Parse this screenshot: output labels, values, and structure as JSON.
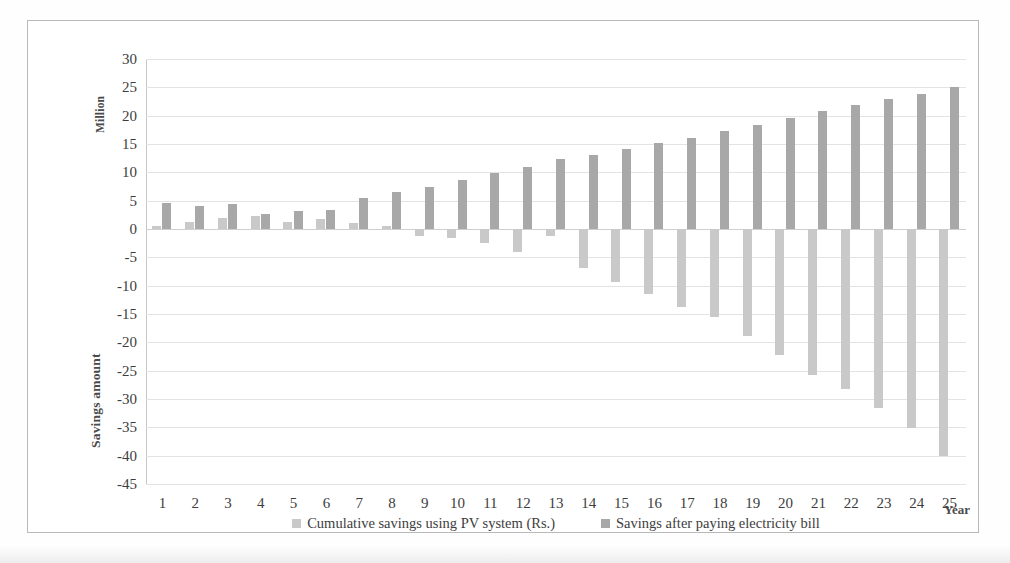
{
  "chart_data": {
    "type": "bar",
    "title": "",
    "xlabel": "Year",
    "ylabel": "Savings amount",
    "y_secondary_label": "Million",
    "grid": true,
    "legend_position": "bottom",
    "ylim": [
      -45,
      30
    ],
    "ytick_step": 5,
    "yticks": [
      "30",
      "25",
      "20",
      "15",
      "10",
      "5",
      "0",
      "-5",
      "-10",
      "-15",
      "-20",
      "-25",
      "-30",
      "-35",
      "-40",
      "-45"
    ],
    "ytick_values": [
      30,
      25,
      20,
      15,
      10,
      5,
      0,
      -5,
      -10,
      -15,
      -20,
      -25,
      -30,
      -35,
      -40,
      -45
    ],
    "categories": [
      "1",
      "2",
      "3",
      "4",
      "5",
      "6",
      "7",
      "8",
      "9",
      "10",
      "11",
      "12",
      "13",
      "14",
      "15",
      "16",
      "17",
      "18",
      "19",
      "20",
      "21",
      "22",
      "23",
      "24",
      "25"
    ],
    "series": [
      {
        "name": "Cumulative savings using PV system (Rs.)",
        "color": "#c9c9c9",
        "values": [
          0.5,
          1.2,
          1.9,
          2.3,
          1.3,
          1.8,
          1.1,
          0.5,
          -1.2,
          -1.6,
          -2.4,
          -4.0,
          -1.2,
          -6.8,
          -9.3,
          -11.4,
          -13.8,
          -15.6,
          -18.9,
          -22.3,
          -25.8,
          -28.3,
          -31.6,
          -35.2,
          -40.1
        ]
      },
      {
        "name": "Savings after paying electricity bill",
        "color": "#a8a8a8",
        "values": [
          4.6,
          4.1,
          4.4,
          2.7,
          3.2,
          3.3,
          5.5,
          6.6,
          7.4,
          8.7,
          9.9,
          11.0,
          12.3,
          13.1,
          14.2,
          15.2,
          16.0,
          17.3,
          18.3,
          19.6,
          20.8,
          21.8,
          22.9,
          23.9,
          25.0
        ]
      }
    ]
  },
  "legend": [
    {
      "label": "Cumulative savings using PV system (Rs.)",
      "swatch": "#c9c9c9"
    },
    {
      "label": "Savings after paying electricity bill",
      "swatch": "#a8a8a8"
    }
  ]
}
